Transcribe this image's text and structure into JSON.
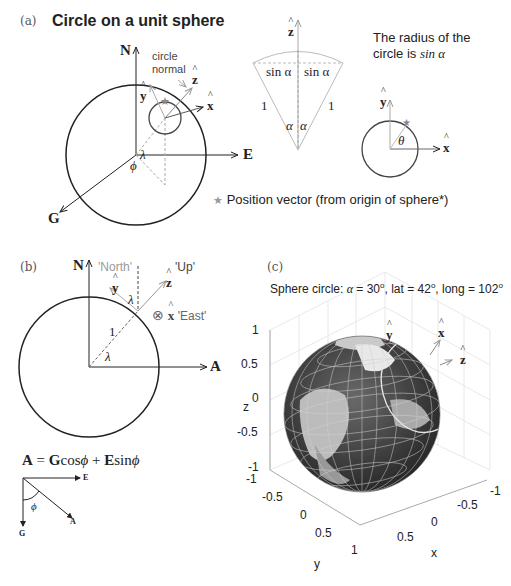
{
  "panel_a": {
    "label": "(a)",
    "title": "Circle on a unit sphere",
    "axes": {
      "north": "N",
      "east": "E",
      "g": "G"
    },
    "vectors": {
      "z_hat": "z",
      "y_hat": "y",
      "x_hat": "x"
    },
    "annotation_circle_normal_line1": "circle",
    "annotation_circle_normal_line2": "normal",
    "angle_lambda": "λ",
    "angle_phi": "ϕ",
    "cone": {
      "z_hat": "z",
      "sin_left": "sin α",
      "sin_right": "sin α",
      "side_left": "1",
      "side_right": "1",
      "alpha_left": "α",
      "alpha_right": "α"
    },
    "radius_note_line1": "The radius of the",
    "radius_note_line2_prefix": "circle is ",
    "radius_note_line2_math": "sin α",
    "small_circle": {
      "y_hat": "y",
      "x_hat": "x",
      "theta": "θ"
    },
    "legend": {
      "star_icon": "★",
      "text": "Position vector (from origin of sphere*)"
    }
  },
  "panel_b": {
    "label": "(b)",
    "axes": {
      "north": "N",
      "a": "A"
    },
    "north_label": "'North'",
    "up_label": "'Up'",
    "east_label": "'East'",
    "vectors": {
      "y_hat": "y",
      "z_hat": "z",
      "x_hat": "x"
    },
    "otimes": "⊗",
    "radius": "1",
    "lambda_top": "λ",
    "lambda_bottom": "λ",
    "equation": {
      "lhs": "A",
      "eq": " = ",
      "g": "G",
      "cos": "cos",
      "phi1": "ϕ",
      "plus": " + ",
      "e": "E",
      "sin": "sin",
      "phi2": "ϕ"
    },
    "inset": {
      "e": "E",
      "g": "G",
      "a": "A",
      "phi": "ϕ"
    }
  },
  "panel_c": {
    "label": "(c)",
    "title_prefix": "Sphere circle: ",
    "title_alpha": "α",
    "title_rest_1": " = 30",
    "title_rest_2": ", lat = 42",
    "title_rest_3": ", long = 102",
    "degree": "o",
    "z_axis_label": "z",
    "x_axis_label": "x",
    "y_axis_label": "y",
    "z_ticks": [
      "1",
      "0.5",
      "0",
      "-0.5",
      "-1"
    ],
    "y_ticks": [
      "-1",
      "-0.5",
      "0",
      "0.5",
      "1"
    ],
    "x_ticks": [
      "-1",
      "-0.5",
      "0",
      "0.5"
    ],
    "vectors": {
      "x_hat": "x",
      "z_hat": "z",
      "y_hat": "y"
    }
  },
  "colors": {
    "line": "#222222",
    "light_line": "#9a9a9a",
    "dashed": "#aaaaaa",
    "globe_dark": "#3a3a3a",
    "globe_land": "#bdbdbd",
    "grid": "#dddddd"
  }
}
